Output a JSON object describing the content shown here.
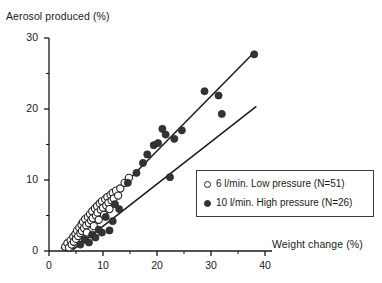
{
  "chart_data": {
    "type": "scatter",
    "title": "",
    "xlabel": "Weight change (%)",
    "ylabel": "Aerosol produced (%)",
    "xlim": [
      0,
      40
    ],
    "ylim": [
      0,
      30
    ],
    "xticks": [
      0,
      10,
      20,
      30,
      40
    ],
    "yticks": [
      0,
      10,
      20,
      30
    ],
    "x_minor_ticks": [
      5,
      15,
      25,
      35
    ],
    "y_minor_ticks": [
      5,
      15,
      25
    ],
    "grid": false,
    "legend_position": "lower-right",
    "series": [
      {
        "name": "6 l/min. Low pressure (N=51)",
        "marker": "open-circle",
        "color": "#ffffff",
        "edge_color": "#202020",
        "n": 51,
        "points": [
          [
            3.0,
            0.6
          ],
          [
            3.4,
            1.1
          ],
          [
            3.7,
            0.5
          ],
          [
            4.0,
            1.5
          ],
          [
            4.2,
            0.9
          ],
          [
            4.5,
            2.0
          ],
          [
            4.6,
            1.3
          ],
          [
            4.9,
            2.4
          ],
          [
            5.0,
            1.7
          ],
          [
            5.2,
            2.9
          ],
          [
            5.4,
            2.1
          ],
          [
            5.6,
            3.3
          ],
          [
            5.8,
            2.5
          ],
          [
            6.0,
            3.7
          ],
          [
            6.1,
            2.8
          ],
          [
            6.3,
            4.1
          ],
          [
            6.5,
            3.2
          ],
          [
            6.7,
            4.5
          ],
          [
            6.9,
            3.6
          ],
          [
            7.0,
            2.6
          ],
          [
            7.2,
            4.8
          ],
          [
            7.4,
            3.9
          ],
          [
            7.6,
            5.2
          ],
          [
            7.8,
            4.3
          ],
          [
            8.0,
            5.6
          ],
          [
            8.1,
            4.6
          ],
          [
            8.3,
            3.5
          ],
          [
            8.5,
            6.0
          ],
          [
            8.7,
            5.0
          ],
          [
            8.9,
            6.3
          ],
          [
            9.0,
            5.4
          ],
          [
            9.2,
            4.4
          ],
          [
            9.4,
            6.7
          ],
          [
            9.6,
            5.8
          ],
          [
            9.8,
            7.0
          ],
          [
            10.0,
            6.1
          ],
          [
            10.2,
            5.1
          ],
          [
            10.4,
            7.3
          ],
          [
            10.6,
            6.4
          ],
          [
            10.8,
            7.6
          ],
          [
            11.0,
            6.8
          ],
          [
            11.2,
            5.9
          ],
          [
            11.4,
            7.9
          ],
          [
            11.6,
            7.1
          ],
          [
            11.8,
            8.2
          ],
          [
            12.0,
            7.4
          ],
          [
            12.4,
            8.5
          ],
          [
            12.8,
            7.8
          ],
          [
            13.2,
            8.8
          ],
          [
            14.0,
            9.6
          ],
          [
            14.8,
            10.3
          ]
        ]
      },
      {
        "name": "10 l/min. High pressure (N=26)",
        "marker": "filled-circle",
        "color": "#333333",
        "edge_color": "#2a2a2a",
        "n": 26,
        "points": [
          [
            5.8,
            0.9
          ],
          [
            6.6,
            1.6
          ],
          [
            7.4,
            1.2
          ],
          [
            8.0,
            2.3
          ],
          [
            8.6,
            1.9
          ],
          [
            9.2,
            3.0
          ],
          [
            9.8,
            2.6
          ],
          [
            10.5,
            4.8
          ],
          [
            11.2,
            2.9
          ],
          [
            11.8,
            4.2
          ],
          [
            12.2,
            6.6
          ],
          [
            13.0,
            5.9
          ],
          [
            14.6,
            9.6
          ],
          [
            16.2,
            11.0
          ],
          [
            17.4,
            12.4
          ],
          [
            18.2,
            13.6
          ],
          [
            19.4,
            14.9
          ],
          [
            20.2,
            15.2
          ],
          [
            21.0,
            17.2
          ],
          [
            21.6,
            16.4
          ],
          [
            22.4,
            10.4
          ],
          [
            23.2,
            15.8
          ],
          [
            24.6,
            17.0
          ],
          [
            28.8,
            22.5
          ],
          [
            31.4,
            21.9
          ],
          [
            32.0,
            19.3
          ],
          [
            38.0,
            27.7
          ]
        ]
      }
    ],
    "fit_lines": [
      {
        "name": "high-pressure-fit",
        "slope": 0.772,
        "intercept": -1.35,
        "x_start": 2.2,
        "x_end": 38.2,
        "color": "#1a1a1a"
      },
      {
        "name": "low-pressure-fit",
        "slope": 0.594,
        "intercept": -2.45,
        "x_start": 4.4,
        "x_end": 38.4,
        "color": "#1a1a1a"
      }
    ]
  },
  "axis": {
    "y_title": "Aerosol produced (%)",
    "x_title": "Weight change (%)",
    "y_tick_labels": [
      "0",
      "10",
      "20",
      "30"
    ],
    "x_tick_labels": [
      "0",
      "10",
      "20",
      "30",
      "40"
    ]
  },
  "legend": {
    "entries": [
      {
        "label": "6 l/min. Low pressure (N=51)",
        "marker": "open-circle"
      },
      {
        "label": "10 l/min. High pressure (N=26)",
        "marker": "filled-circle"
      }
    ]
  },
  "colors": {
    "axis": "#1a1a1a",
    "open_marker_fill": "#ffffff",
    "open_marker_edge": "#202020",
    "filled_marker": "#333333",
    "line": "#1a1a1a",
    "background": "#ffffff"
  }
}
